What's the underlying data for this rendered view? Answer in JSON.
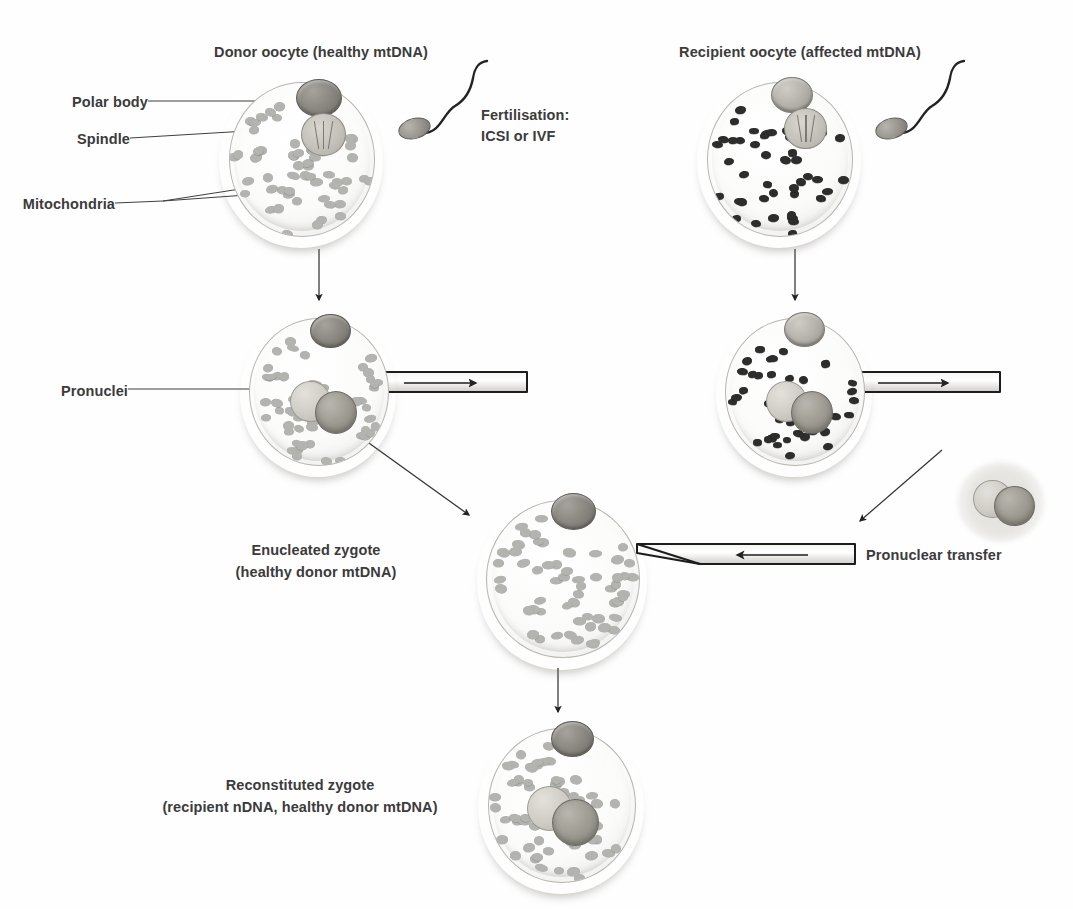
{
  "diagram": {
    "colors": {
      "zona_pellucida": "#8a8077",
      "ooplasm": "#fbfbfa",
      "healthy_mitochondria": "#b3b3b0",
      "affected_mitochondria": "#2d2d2d",
      "polar_body": "#8b8882",
      "spindle": "#c4c1ba",
      "line": "#3a3a3a",
      "text": "#3b3b3b"
    }
  },
  "labels": {
    "donor_oocyte": "Donor oocyte (healthy mtDNA)",
    "recipient_oocyte": "Recipient oocyte (affected mtDNA)",
    "polar_body": "Polar body",
    "spindle": "Spindle",
    "mitochondria": "Mitochondria",
    "fertilisation_line1": "Fertilisation:",
    "fertilisation_line2": "ICSI or IVF",
    "pronuclei": "Pronuclei",
    "enucleated_line1": "Enucleated zygote",
    "enucleated_line2": "(healthy donor mtDNA)",
    "pronuclear_transfer": "Pronuclear transfer",
    "reconstituted_line1": "Reconstituted zygote",
    "reconstituted_line2": "(recipient nDNA, healthy donor mtDNA)"
  },
  "cells": {
    "donor_oocyte": {
      "name": "Donor oocyte",
      "mtDNA": "healthy",
      "has_polar_body": true,
      "has_spindle": true,
      "has_pronuclei": false
    },
    "recipient_oocyte": {
      "name": "Recipient oocyte",
      "mtDNA": "affected",
      "has_polar_body": true,
      "has_spindle": true,
      "has_pronuclei": false
    },
    "donor_zygote": {
      "name": "Donor zygote",
      "mtDNA": "healthy",
      "has_polar_body": true,
      "has_spindle": false,
      "has_pronuclei": true
    },
    "recipient_zygote": {
      "name": "Recipient zygote",
      "mtDNA": "affected",
      "has_polar_body": true,
      "has_spindle": false,
      "has_pronuclei": true
    },
    "enucleated_zygote": {
      "name": "Enucleated zygote",
      "mtDNA": "healthy donor",
      "has_polar_body": true,
      "has_spindle": false,
      "has_pronuclei": false
    },
    "reconstituted_zygote": {
      "name": "Reconstituted zygote",
      "mtDNA": "healthy donor",
      "nDNA": "recipient",
      "has_polar_body": true,
      "has_spindle": false,
      "has_pronuclei": true
    },
    "karyoplast": {
      "name": "Extracted pronuclei karyoplast",
      "pronuclei_count": 2
    }
  },
  "icons": {
    "sperm": "sperm-icon",
    "pipette": "micropipette-icon",
    "arrow_down": "arrow-down-icon",
    "arrow_diagonal": "arrow-diagonal-icon"
  },
  "steps": [
    {
      "order": 1,
      "text": "Donor oocyte (healthy mtDNA)"
    },
    {
      "order": 2,
      "text": "Recipient oocyte (affected mtDNA)"
    },
    {
      "order": 3,
      "text": "Fertilisation: ICSI or IVF"
    },
    {
      "order": 4,
      "text": "Pronuclei removed from both zygotes"
    },
    {
      "order": 5,
      "text": "Enucleated zygote (healthy donor mtDNA)"
    },
    {
      "order": 6,
      "text": "Pronuclear transfer"
    },
    {
      "order": 7,
      "text": "Reconstituted zygote (recipient nDNA, healthy donor mtDNA)"
    }
  ]
}
